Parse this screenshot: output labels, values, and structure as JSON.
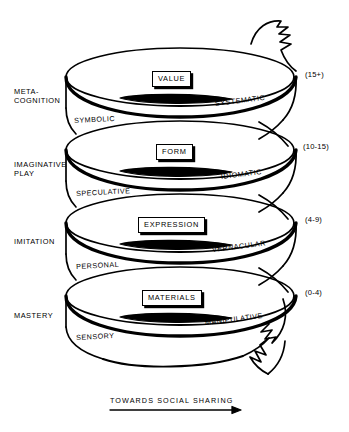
{
  "figure": {
    "caption": "TOWARDS SOCIAL SHARING"
  },
  "stages": [
    {
      "id": "meta-cognition",
      "line1": "META-",
      "line2": "COGNITION"
    },
    {
      "id": "imaginative-play",
      "line1": "IMAGINATIVE",
      "line2": "PLAY"
    },
    {
      "id": "imitation",
      "line1": "IMITATION",
      "line2": ""
    },
    {
      "id": "mastery",
      "line1": "MASTERY",
      "line2": ""
    }
  ],
  "coils": [
    {
      "id": "coil-value",
      "boxed_label": "VALUE",
      "outer_label": "SYSTEMATIC",
      "inner_label": "SYMBOLIC",
      "age_label": "(15+)"
    },
    {
      "id": "coil-form",
      "boxed_label": "FORM",
      "outer_label": "IDIOMATIC",
      "inner_label": "SPECULATIVE",
      "age_label": "(10-15)"
    },
    {
      "id": "coil-expression",
      "boxed_label": "EXPRESSION",
      "outer_label": "VERNACULAR",
      "inner_label": "PERSONAL",
      "age_label": "(4-9)"
    },
    {
      "id": "coil-materials",
      "boxed_label": "MATERIALS",
      "outer_label": "MANIPULATIVE",
      "inner_label": "SENSORY",
      "age_label": "(0-4)"
    }
  ],
  "colors": {
    "ink": "#000000",
    "paper": "#ffffff"
  }
}
